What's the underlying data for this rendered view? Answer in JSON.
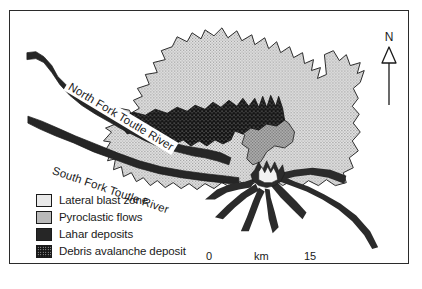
{
  "figure": {
    "name": "mount-st-helens-deposit-map",
    "frame_border_color": "#2b2b2b",
    "background_color": "#ffffff"
  },
  "north_arrow": {
    "letter": "N",
    "icon": "north-arrow-icon"
  },
  "river_labels": [
    {
      "text": "North Fork Toutle River",
      "rotation_deg": 31
    },
    {
      "text": "South Fork Toutle River",
      "rotation_deg": 19
    }
  ],
  "legend": {
    "items": [
      {
        "label": "Lateral blast zone",
        "swatch": "stipple-light",
        "color": "#e9e9e9"
      },
      {
        "label": "Pyroclastic flows",
        "swatch": "stipple-gray",
        "color": "#b9b9b9"
      },
      {
        "label": "Lahar deposits",
        "swatch": "solid-dark",
        "color": "#262626"
      },
      {
        "label": "Debris avalanche deposit",
        "swatch": "speckled-black",
        "color": "#151515"
      }
    ]
  },
  "scale_bar": {
    "zero": "0",
    "unit": "km",
    "max": "15"
  }
}
